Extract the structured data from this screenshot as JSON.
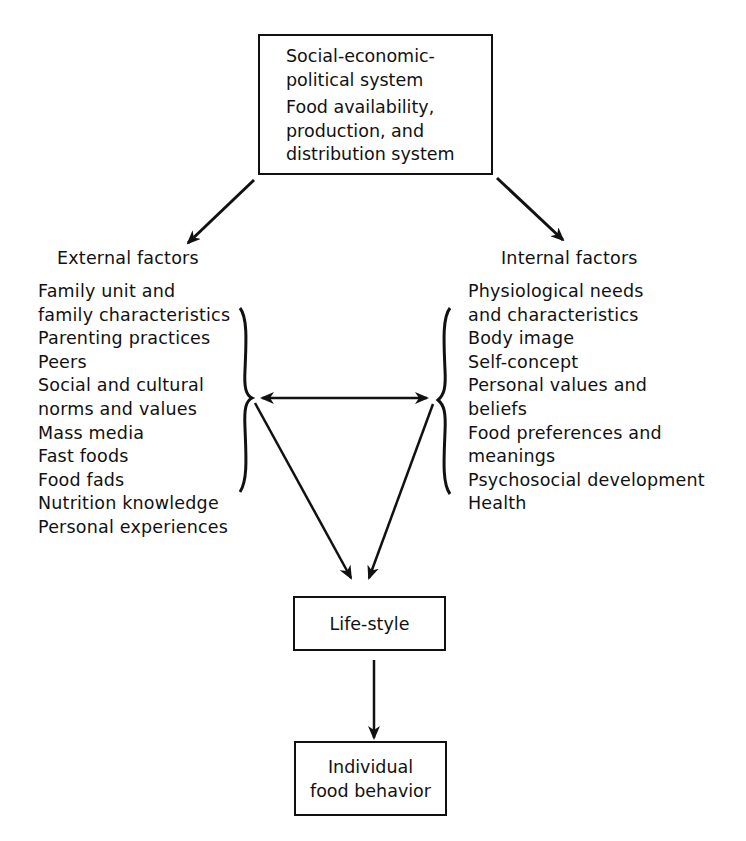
{
  "top_box": {
    "line1": "Social-economic-",
    "line2": "political system",
    "line3": "Food availability,",
    "line4": "production, and",
    "line5": "distribution system"
  },
  "external": {
    "heading": "External factors",
    "items": [
      "Family unit and",
      "family characteristics",
      "Parenting practices",
      "Peers",
      "Social and cultural",
      "norms and values",
      "Mass media",
      "Fast foods",
      "Food fads",
      "Nutrition knowledge",
      "Personal experiences"
    ]
  },
  "internal": {
    "heading": "Internal factors",
    "items": [
      "Physiological needs",
      "and characteristics",
      "Body image",
      "Self-concept",
      "Personal values and",
      "beliefs",
      "Food preferences and",
      "meanings",
      "Psychosocial development",
      "Health"
    ]
  },
  "lifestyle_box": {
    "label": "Life-style"
  },
  "behavior_box": {
    "line1": "Individual",
    "line2": "food behavior"
  },
  "colors": {
    "ink": "#111111",
    "background": "#ffffff"
  }
}
